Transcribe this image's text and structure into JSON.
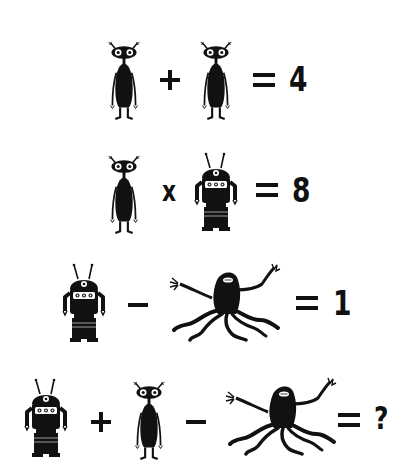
{
  "puzzle": {
    "type": "symbol-math-riddle",
    "symbols": {
      "alien": "slender alien with big eyes",
      "robot": "robot with antennas",
      "monster": "tentacle monster"
    },
    "equations": [
      {
        "terms": [
          "alien",
          "alien"
        ],
        "operators": [
          "+"
        ],
        "result": "4"
      },
      {
        "terms": [
          "alien",
          "robot"
        ],
        "operators": [
          "x"
        ],
        "result": "8"
      },
      {
        "terms": [
          "robot",
          "monster"
        ],
        "operators": [
          "−"
        ],
        "result": "1"
      },
      {
        "terms": [
          "robot",
          "alien",
          "monster"
        ],
        "operators": [
          "+",
          "−"
        ],
        "result": "?"
      }
    ]
  },
  "labels": {
    "times": "x",
    "result_1": "4",
    "result_2": "8",
    "result_3": "1",
    "result_4": "?"
  }
}
